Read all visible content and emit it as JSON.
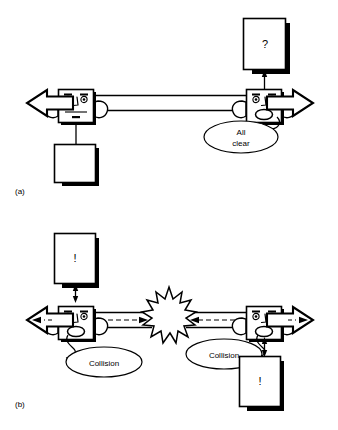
{
  "figure": {
    "background_color": "#ffffff",
    "ink_color": "#000000",
    "panels": [
      {
        "id": "a",
        "label": "(a)",
        "caption_glyph_left_box": "",
        "right_box_glyph": "?",
        "robots": [
          {
            "side": "left",
            "mouth": "closed",
            "speaking": false
          },
          {
            "side": "right",
            "mouth": "open",
            "speaking": true
          }
        ],
        "speech_bubbles": [
          {
            "owner": "right-robot",
            "line1": "All",
            "line2": "clear"
          }
        ],
        "channel": {
          "style": "double-line",
          "inner_arrow": "none"
        }
      },
      {
        "id": "b",
        "label": "(b)",
        "left_box_glyph": "!",
        "right_box_glyph": "!",
        "robots": [
          {
            "side": "left",
            "mouth": "open",
            "speaking": true
          },
          {
            "side": "right",
            "mouth": "open",
            "speaking": true
          }
        ],
        "speech_bubbles": [
          {
            "owner": "left-robot",
            "line1": "Collision",
            "line2": ""
          },
          {
            "owner": "right-robot",
            "line1": "Collision",
            "line2": ""
          }
        ],
        "channel": {
          "style": "double-line",
          "inner_arrow": "dashed"
        },
        "explosion": {
          "shape": "starburst",
          "label": ""
        }
      }
    ]
  }
}
